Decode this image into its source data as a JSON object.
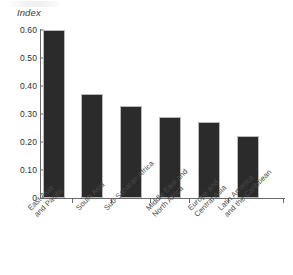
{
  "chart_data": {
    "type": "bar",
    "title": "",
    "subtitle": "",
    "xlabel": "",
    "ylabel": "Index",
    "ylim": [
      0,
      0.6
    ],
    "yticks": [
      "0",
      "0.10",
      "0.20",
      "0.30",
      "0.40",
      "0.50",
      "0.60"
    ],
    "ytick_values": [
      0,
      0.1,
      0.2,
      0.3,
      0.4,
      0.5,
      0.6
    ],
    "grid": false,
    "legend": false,
    "bar_color": "#2b2b2b",
    "axis_color": "#6b6b6b",
    "categories": [
      "East Asia\nand Pacific",
      "South Asia",
      "Sub-Saharan Africa",
      "Middle East and\nNorth Africa",
      "Europe and\nCentral Asia",
      "Latin America\nand the Caribbean"
    ],
    "values": [
      0.6,
      0.37,
      0.33,
      0.29,
      0.27,
      0.22
    ]
  },
  "axis": {
    "y_title": "Index",
    "y_tick_0": "0",
    "y_tick_1": "0.10",
    "y_tick_2": "0.20",
    "y_tick_3": "0.30",
    "y_tick_4": "0.40",
    "y_tick_5": "0.50",
    "y_tick_6": "0.60"
  },
  "x_labels": {
    "c0": "East Asia\nand Pacific",
    "c1": "South Asia",
    "c2": "Sub-Saharan Africa",
    "c3": "Middle East and\nNorth Africa",
    "c4": "Europe and\nCentral Asia",
    "c5": "Latin America\nand the Caribbean"
  }
}
